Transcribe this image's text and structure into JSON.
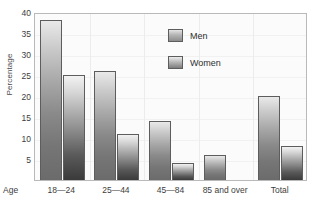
{
  "chart_data": {
    "type": "bar",
    "title": "",
    "xlabel": "Age",
    "ylabel": "Percentage",
    "categories": [
      "18—24",
      "25—44",
      "45—84",
      "85 and over",
      "Total"
    ],
    "series": [
      {
        "name": "Men",
        "values": [
          38,
          26,
          14,
          6,
          20
        ]
      },
      {
        "name": "Women",
        "values": [
          25,
          11,
          4,
          null,
          8
        ]
      }
    ],
    "ylim": [
      0,
      40
    ],
    "yticks": [
      40,
      35,
      30,
      25,
      20,
      15,
      10,
      5
    ],
    "grid": true,
    "legend_position": "upper-right",
    "colors": {
      "men_top": "#e9e9e9",
      "men_bottom": "#6b6b6b",
      "women_top": "#f2f2f2",
      "women_bottom": "#3a3a3a",
      "bar_outline": "#5d5d5d",
      "plot_background": "#fbfbfb",
      "plot_border": "#b9b9b9",
      "gridline": "#ececec",
      "text": "#3d3d3d"
    }
  },
  "legend": {
    "items": [
      {
        "label": "Men",
        "swatch": "men-swatch-icon"
      },
      {
        "label": "Women",
        "swatch": "women-swatch-icon"
      }
    ]
  },
  "axes": {
    "y_title": "Percentage",
    "x_axis_name": "Age",
    "y_tick_labels": [
      "40",
      "35",
      "30",
      "25",
      "20",
      "15",
      "10",
      "5"
    ],
    "x_tick_labels": [
      "18—24",
      "25—44",
      "45—84",
      "85 and over",
      "Total"
    ]
  }
}
